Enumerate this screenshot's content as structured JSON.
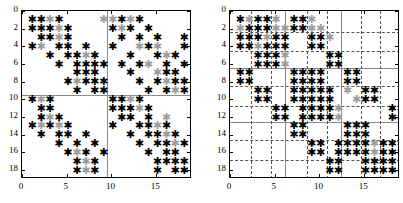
{
  "figure": {
    "type": "spy-matrix-pair"
  },
  "chart_data": [
    {
      "id": "left",
      "type": "scatter",
      "title": "",
      "xlabel": "",
      "ylabel": "",
      "xlim": [
        0,
        19
      ],
      "ylim": [
        19,
        0
      ],
      "xticks": [
        0,
        5,
        10,
        15
      ],
      "yticks": [
        0,
        2,
        4,
        6,
        8,
        10,
        12,
        14,
        16,
        18
      ],
      "xticklabels": [
        "0",
        "5",
        "10",
        "15"
      ],
      "yticklabels": [
        "0",
        "2",
        "4",
        "6",
        "8",
        "10",
        "12",
        "14",
        "16",
        "18"
      ],
      "grid": false,
      "marker": "asterisk",
      "colors": {
        "primary": "#000000",
        "secondary": "#9c9c9c"
      },
      "partition_lines": {
        "solid_vertical_x": [
          9.5
        ],
        "solid_horizontal_y": [
          9.5
        ],
        "dashed_vertical_x": [],
        "dashed_horizontal_y": []
      },
      "points_black": [
        [
          1,
          1
        ],
        [
          2,
          1
        ],
        [
          4,
          1
        ],
        [
          1,
          2
        ],
        [
          2,
          2
        ],
        [
          3,
          2
        ],
        [
          5,
          2
        ],
        [
          2,
          3
        ],
        [
          3,
          3
        ],
        [
          5,
          3
        ],
        [
          1,
          4
        ],
        [
          4,
          4
        ],
        [
          5,
          4
        ],
        [
          7,
          4
        ],
        [
          3,
          5
        ],
        [
          5,
          5
        ],
        [
          6,
          5
        ],
        [
          8,
          5
        ],
        [
          4,
          6
        ],
        [
          6,
          6
        ],
        [
          7,
          6
        ],
        [
          8,
          6
        ],
        [
          9,
          6
        ],
        [
          6,
          7
        ],
        [
          7,
          7
        ],
        [
          8,
          7
        ],
        [
          5,
          8
        ],
        [
          7,
          8
        ],
        [
          8,
          8
        ],
        [
          9,
          8
        ],
        [
          6,
          9
        ],
        [
          8,
          9
        ],
        [
          9,
          9
        ],
        [
          1,
          10
        ],
        [
          3,
          10
        ],
        [
          2,
          11
        ],
        [
          3,
          11
        ],
        [
          1,
          13
        ],
        [
          3,
          13
        ],
        [
          5,
          13
        ],
        [
          2,
          14
        ],
        [
          4,
          14
        ],
        [
          5,
          14
        ],
        [
          7,
          14
        ],
        [
          4,
          15
        ],
        [
          6,
          15
        ],
        [
          8,
          15
        ],
        [
          5,
          16
        ],
        [
          7,
          16
        ],
        [
          9,
          16
        ],
        [
          6,
          17
        ],
        [
          8,
          17
        ],
        [
          6,
          18
        ],
        [
          8,
          18
        ],
        [
          2,
          12
        ],
        [
          4,
          12
        ],
        [
          11,
          1
        ],
        [
          13,
          1
        ],
        [
          10,
          2
        ],
        [
          12,
          2
        ],
        [
          14,
          2
        ],
        [
          11,
          3
        ],
        [
          13,
          3
        ],
        [
          15,
          3
        ],
        [
          18,
          3
        ],
        [
          10,
          4
        ],
        [
          14,
          4
        ],
        [
          18,
          4
        ],
        [
          12,
          5
        ],
        [
          15,
          5
        ],
        [
          17,
          5
        ],
        [
          11,
          6
        ],
        [
          13,
          6
        ],
        [
          16,
          6
        ],
        [
          18,
          6
        ],
        [
          12,
          7
        ],
        [
          16,
          7
        ],
        [
          17,
          7
        ],
        [
          13,
          8
        ],
        [
          15,
          8
        ],
        [
          17,
          8
        ],
        [
          18,
          8
        ],
        [
          14,
          9
        ],
        [
          16,
          9
        ],
        [
          18,
          9
        ],
        [
          10,
          10
        ],
        [
          11,
          10
        ],
        [
          13,
          10
        ],
        [
          10,
          11
        ],
        [
          11,
          11
        ],
        [
          12,
          11
        ],
        [
          14,
          11
        ],
        [
          11,
          12
        ],
        [
          12,
          12
        ],
        [
          14,
          12
        ],
        [
          10,
          13
        ],
        [
          13,
          13
        ],
        [
          14,
          13
        ],
        [
          16,
          13
        ],
        [
          12,
          14
        ],
        [
          14,
          14
        ],
        [
          15,
          14
        ],
        [
          17,
          14
        ],
        [
          13,
          15
        ],
        [
          15,
          15
        ],
        [
          16,
          15
        ],
        [
          18,
          15
        ],
        [
          14,
          16
        ],
        [
          16,
          16
        ],
        [
          17,
          16
        ],
        [
          15,
          17
        ],
        [
          16,
          17
        ],
        [
          17,
          17
        ],
        [
          18,
          17
        ],
        [
          15,
          18
        ],
        [
          17,
          18
        ],
        [
          18,
          18
        ]
      ],
      "points_gray": [
        [
          3,
          1
        ],
        [
          9,
          1
        ],
        [
          4,
          2
        ],
        [
          4,
          3
        ],
        [
          2,
          4
        ],
        [
          7,
          5
        ],
        [
          6,
          8
        ],
        [
          2,
          10
        ],
        [
          3,
          12
        ],
        [
          2,
          13
        ],
        [
          4,
          13
        ],
        [
          6,
          16
        ],
        [
          7,
          17
        ],
        [
          7,
          18
        ],
        [
          10,
          1
        ],
        [
          12,
          1
        ],
        [
          11,
          2
        ],
        [
          13,
          4
        ],
        [
          15,
          4
        ],
        [
          16,
          5
        ],
        [
          14,
          6
        ],
        [
          15,
          7
        ],
        [
          16,
          8
        ],
        [
          17,
          9
        ],
        [
          12,
          10
        ],
        [
          13,
          11
        ],
        [
          15,
          13
        ],
        [
          16,
          14
        ],
        [
          17,
          15
        ],
        [
          16,
          12
        ]
      ]
    },
    {
      "id": "right",
      "type": "scatter",
      "title": "",
      "xlabel": "",
      "ylabel": "",
      "xlim": [
        0,
        19
      ],
      "ylim": [
        19,
        0
      ],
      "xticks": [
        0,
        5,
        10,
        15
      ],
      "yticks": [
        0,
        2,
        4,
        6,
        8,
        10,
        12,
        14,
        16,
        18
      ],
      "xticklabels": [
        "0",
        "5",
        "10",
        "15"
      ],
      "yticklabels": [
        "0",
        "2",
        "4",
        "6",
        "8",
        "10",
        "12",
        "14",
        "16",
        "18"
      ],
      "grid": true,
      "marker": "asterisk",
      "colors": {
        "primary": "#000000",
        "secondary": "#9c9c9c"
      },
      "partition_lines": {
        "solid_vertical_x": [
          6.2,
          12.4
        ],
        "solid_horizontal_y": [
          6.4,
          12.5
        ],
        "dashed_vertical_x": [
          2.4,
          4.6,
          8.6,
          10.8,
          14.6,
          16.8
        ],
        "dashed_horizontal_y": [
          2.4,
          4.5,
          8.5,
          10.8,
          14.6,
          16.8
        ]
      },
      "points_black": [
        [
          1,
          1
        ],
        [
          3,
          1
        ],
        [
          4,
          1
        ],
        [
          7,
          1
        ],
        [
          8,
          1
        ],
        [
          2,
          2
        ],
        [
          3,
          2
        ],
        [
          4,
          2
        ],
        [
          7,
          2
        ],
        [
          8,
          2
        ],
        [
          1,
          3
        ],
        [
          2,
          3
        ],
        [
          3,
          3
        ],
        [
          5,
          3
        ],
        [
          6,
          3
        ],
        [
          9,
          3
        ],
        [
          10,
          3
        ],
        [
          1,
          4
        ],
        [
          2,
          4
        ],
        [
          4,
          4
        ],
        [
          5,
          4
        ],
        [
          6,
          4
        ],
        [
          9,
          4
        ],
        [
          10,
          4
        ],
        [
          3,
          5
        ],
        [
          4,
          5
        ],
        [
          5,
          5
        ],
        [
          11,
          5
        ],
        [
          12,
          5
        ],
        [
          3,
          6
        ],
        [
          4,
          6
        ],
        [
          5,
          6
        ],
        [
          11,
          6
        ],
        [
          12,
          6
        ],
        [
          1,
          7
        ],
        [
          2,
          7
        ],
        [
          7,
          7
        ],
        [
          8,
          7
        ],
        [
          9,
          7
        ],
        [
          10,
          7
        ],
        [
          13,
          7
        ],
        [
          14,
          7
        ],
        [
          1,
          8
        ],
        [
          2,
          8
        ],
        [
          7,
          8
        ],
        [
          8,
          8
        ],
        [
          9,
          8
        ],
        [
          10,
          8
        ],
        [
          13,
          8
        ],
        [
          14,
          8
        ],
        [
          3,
          9
        ],
        [
          4,
          9
        ],
        [
          7,
          9
        ],
        [
          8,
          9
        ],
        [
          9,
          9
        ],
        [
          10,
          9
        ],
        [
          11,
          9
        ],
        [
          15,
          9
        ],
        [
          16,
          9
        ],
        [
          3,
          10
        ],
        [
          4,
          10
        ],
        [
          7,
          10
        ],
        [
          8,
          10
        ],
        [
          9,
          10
        ],
        [
          10,
          10
        ],
        [
          11,
          10
        ],
        [
          15,
          10
        ],
        [
          16,
          10
        ],
        [
          5,
          11
        ],
        [
          6,
          11
        ],
        [
          8,
          11
        ],
        [
          9,
          11
        ],
        [
          10,
          11
        ],
        [
          11,
          11
        ],
        [
          18,
          11
        ],
        [
          19,
          11
        ],
        [
          5,
          12
        ],
        [
          6,
          12
        ],
        [
          8,
          12
        ],
        [
          9,
          12
        ],
        [
          10,
          12
        ],
        [
          11,
          12
        ],
        [
          18,
          12
        ],
        [
          19,
          12
        ],
        [
          7,
          13
        ],
        [
          8,
          13
        ],
        [
          13,
          13
        ],
        [
          14,
          13
        ],
        [
          15,
          13
        ],
        [
          7,
          14
        ],
        [
          8,
          14
        ],
        [
          13,
          14
        ],
        [
          14,
          14
        ],
        [
          15,
          14
        ],
        [
          9,
          15
        ],
        [
          10,
          15
        ],
        [
          12,
          15
        ],
        [
          13,
          15
        ],
        [
          14,
          15
        ],
        [
          15,
          15
        ],
        [
          17,
          15
        ],
        [
          18,
          15
        ],
        [
          19,
          15
        ],
        [
          9,
          16
        ],
        [
          10,
          16
        ],
        [
          12,
          16
        ],
        [
          13,
          16
        ],
        [
          14,
          16
        ],
        [
          15,
          16
        ],
        [
          17,
          16
        ],
        [
          18,
          16
        ],
        [
          19,
          16
        ],
        [
          11,
          17
        ],
        [
          12,
          17
        ],
        [
          15,
          17
        ],
        [
          16,
          17
        ],
        [
          17,
          17
        ],
        [
          18,
          17
        ],
        [
          11,
          18
        ],
        [
          12,
          18
        ],
        [
          15,
          18
        ],
        [
          16,
          18
        ],
        [
          17,
          18
        ],
        [
          18,
          18
        ]
      ],
      "points_gray": [
        [
          2,
          1
        ],
        [
          5,
          1
        ],
        [
          1,
          2
        ],
        [
          5,
          2
        ],
        [
          6,
          2
        ],
        [
          4,
          3
        ],
        [
          3,
          4
        ],
        [
          6,
          5
        ],
        [
          6,
          6
        ],
        [
          9,
          1
        ],
        [
          11,
          3
        ],
        [
          13,
          9
        ],
        [
          14,
          10
        ],
        [
          12,
          11
        ],
        [
          12,
          12
        ],
        [
          16,
          15
        ],
        [
          16,
          16
        ],
        [
          19,
          17
        ],
        [
          19,
          18
        ],
        [
          9,
          2
        ],
        [
          10,
          2
        ]
      ]
    }
  ]
}
